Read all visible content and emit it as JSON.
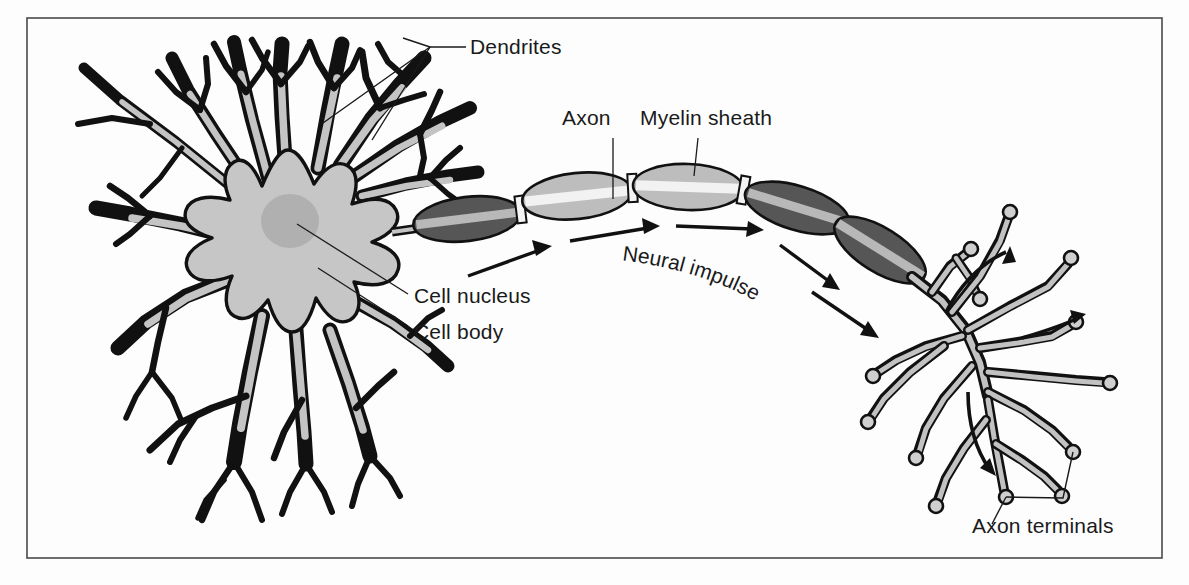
{
  "figure": {
    "background_color": "#fdfdfd",
    "frame_color": "#4a4a4a",
    "ink_color": "#1a1a1a"
  },
  "palette": {
    "soma_fill": "#c6c6c6",
    "nucleus_fill": "#b0b0b0",
    "myelin_dark": "#565656",
    "myelin_light": "#bdbdbd",
    "terminal_fill": "#c2c2c2",
    "outline": "#111111"
  },
  "labels": {
    "dendrites": "Dendrites",
    "axon": "Axon",
    "myelin_sheath": "Myelin sheath",
    "cell_nucleus": "Cell nucleus",
    "cell_body": "Cell body",
    "neural_impulse": "Neural impulse",
    "axon_terminals": "Axon terminals"
  },
  "parts": [
    {
      "id": "dendrites",
      "name": "Dendrites",
      "description": "Branching fibers radiating from the cell body that receive incoming signals"
    },
    {
      "id": "cell-body",
      "name": "Cell body",
      "description": "Star-shaped soma containing the nucleus"
    },
    {
      "id": "cell-nucleus",
      "name": "Cell nucleus",
      "description": "Round darker region at the center of the cell body"
    },
    {
      "id": "axon",
      "name": "Axon",
      "description": "Long fiber carrying the impulse away from the cell body"
    },
    {
      "id": "myelin-sheath",
      "name": "Myelin sheath",
      "description": "Segmented insulating covering along the axon"
    },
    {
      "id": "neural-impulse",
      "name": "Neural impulse",
      "description": "Direction of signal travel along the axon, shown by arrows"
    },
    {
      "id": "axon-terminals",
      "name": "Axon terminals",
      "description": "End branches with knobs that pass the signal on"
    }
  ]
}
